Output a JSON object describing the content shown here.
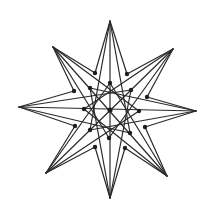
{
  "diagram": {
    "type": "eight-pointed-star-graph",
    "width": 207,
    "height": 212,
    "line_color": "#2a2a2a",
    "dot_color": "#1e1e1e",
    "center": [
      110,
      110
    ],
    "outer_tips": [
      [
        110,
        21
      ],
      [
        173,
        49
      ],
      [
        196,
        111
      ],
      [
        167,
        176
      ],
      [
        110,
        198
      ],
      [
        46,
        173
      ],
      [
        19,
        107
      ],
      [
        53,
        47
      ]
    ],
    "notch_dots": [
      [
        127,
        74
      ],
      [
        147,
        97
      ],
      [
        145,
        127
      ],
      [
        125,
        148
      ],
      [
        95,
        147
      ],
      [
        75,
        126
      ],
      [
        74,
        91
      ],
      [
        95,
        73
      ]
    ],
    "inner_dots": [
      [
        110,
        83
      ],
      [
        131,
        90
      ],
      [
        139,
        111
      ],
      [
        130,
        133
      ],
      [
        109,
        138
      ],
      [
        90,
        130
      ],
      [
        84,
        109
      ],
      [
        90,
        88
      ]
    ]
  }
}
